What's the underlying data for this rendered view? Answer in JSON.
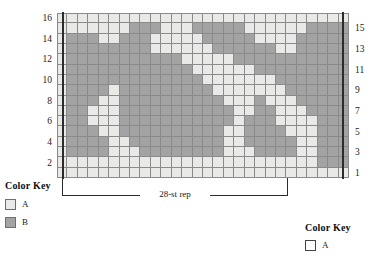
{
  "chart_data": {
    "type": "heatmap",
    "title": "",
    "xlabel": "",
    "ylabel": "",
    "columns": 28,
    "rows": 16,
    "repeat_label": "28-st rep",
    "legend_position": "bottom-left",
    "grid": true,
    "palette": {
      "A": "#e9e9e7",
      "B": "#a3a3a3"
    },
    "row_labels_left": [
      "16",
      "14",
      "12",
      "10",
      "8",
      "6",
      "4",
      "2"
    ],
    "row_labels_right": [
      "15",
      "13",
      "11",
      "9",
      "7",
      "5",
      "3",
      "1"
    ],
    "row_order": "bottom-to-top",
    "cells": [
      "AAAAAAAAAAAAAAAAAAAAAAAAAAAA",
      "AAAAAAAAAAAAAAAAAAAAAAAAABBB",
      "ABBBBAAABBBBBBBBAAABBBBAABBBB",
      "ABBBBAABBBBBBBBBAABBBBBAABBBA",
      "ABBBAABBBBBBBBBBAABBBBAAABBBA",
      "ABBAAABBBBBBBBBBBABBBAAAABBBA",
      "ABBAAABBBBBBBBBBBAABBAAABBBBA",
      "ABBBAABBBBBBBBBBAAABAAABBBBBA",
      "ABBBBABBBBBBBBBAAAAAAABBBBBBA",
      "ABBBBBBBBBBBBBAAAAAAABBBBBBBA",
      "ABBBBBBBBBBBBAAAAAABBBBBBBBBA",
      "ABBBBBBBBBBBAAAAABBBBBBBBBBBA",
      "ABBBBBBBBAAAAAABBBBBBAABBBBBA",
      "ABBBAABBBAAAAABBBBBAAAABBBBBA",
      "AAAAAAABBBAAABBBBBAAAAAABBBBA",
      "AAAAAAAAAAAAAAAAAAAAAAAAAAAA"
    ]
  },
  "chart": {
    "repeat_label": "28-st rep"
  },
  "legend_left": {
    "title": "Color Key",
    "items": [
      {
        "swatch": "A",
        "label": "A"
      },
      {
        "swatch": "B",
        "label": "B"
      }
    ]
  },
  "legend_right": {
    "title": "Color Key",
    "items": [
      {
        "swatch": "blank",
        "label": "A"
      }
    ]
  }
}
